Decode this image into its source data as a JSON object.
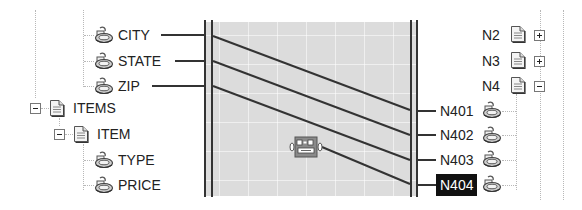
{
  "source_tree": {
    "items": [
      {
        "label": "CITY",
        "type": "field",
        "y": 35
      },
      {
        "label": "STATE",
        "type": "field",
        "y": 61
      },
      {
        "label": "ZIP",
        "type": "field",
        "y": 86
      },
      {
        "label": "ITEMS",
        "type": "element",
        "expanded": true,
        "y": 108
      },
      {
        "label": "ITEM",
        "type": "element",
        "expanded": true,
        "y": 134
      },
      {
        "label": "TYPE",
        "type": "field",
        "y": 160
      },
      {
        "label": "PRICE",
        "type": "field",
        "y": 185
      }
    ]
  },
  "target_tree": {
    "items": [
      {
        "label": "N2",
        "type": "element",
        "expanded": false,
        "y": 35
      },
      {
        "label": "N3",
        "type": "element",
        "expanded": false,
        "y": 61
      },
      {
        "label": "N4",
        "type": "element",
        "expanded": true,
        "y": 86
      },
      {
        "label": "N401",
        "type": "field",
        "y": 111
      },
      {
        "label": "N402",
        "type": "field",
        "y": 135
      },
      {
        "label": "N403",
        "type": "field",
        "y": 160
      },
      {
        "label": "N404",
        "type": "field",
        "selected": true,
        "y": 185
      }
    ]
  },
  "mappings": [
    {
      "from": "CITY",
      "to": "N401"
    },
    {
      "from": "STATE",
      "to": "N402"
    },
    {
      "from": "ZIP",
      "to": "N403"
    },
    {
      "from": "function",
      "to": "N404"
    }
  ],
  "function_node": {
    "icon": "function-block-icon"
  },
  "colors": {
    "canvas": "#dcdcdc",
    "line": "#333333",
    "selected_bg": "#111111",
    "selected_fg": "#ffffff"
  }
}
